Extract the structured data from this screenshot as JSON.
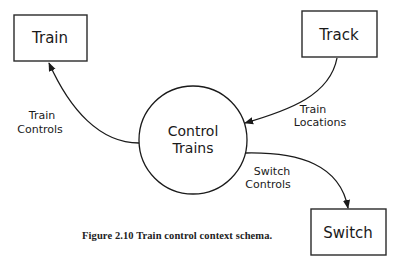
{
  "figure": {
    "caption": "Figure 2.10  Train control context schema."
  },
  "terminators": [
    {
      "id": "train",
      "label": "Train"
    },
    {
      "id": "track",
      "label": "Track"
    },
    {
      "id": "switch",
      "label": "Switch"
    }
  ],
  "process": {
    "line1": "Control",
    "line2": "Trains"
  },
  "flows": [
    {
      "id": "train-controls",
      "line1": "Train",
      "line2": "Controls",
      "from": "Control Trains",
      "to": "Train"
    },
    {
      "id": "train-locations",
      "line1": "Train",
      "line2": "Locations",
      "from": "Track",
      "to": "Control Trains"
    },
    {
      "id": "switch-controls",
      "line1": "Switch",
      "line2": "Controls",
      "from": "Control Trains",
      "to": "Switch"
    }
  ],
  "colors": {
    "ink": "#1a1a1a",
    "background": "#ffffff"
  }
}
